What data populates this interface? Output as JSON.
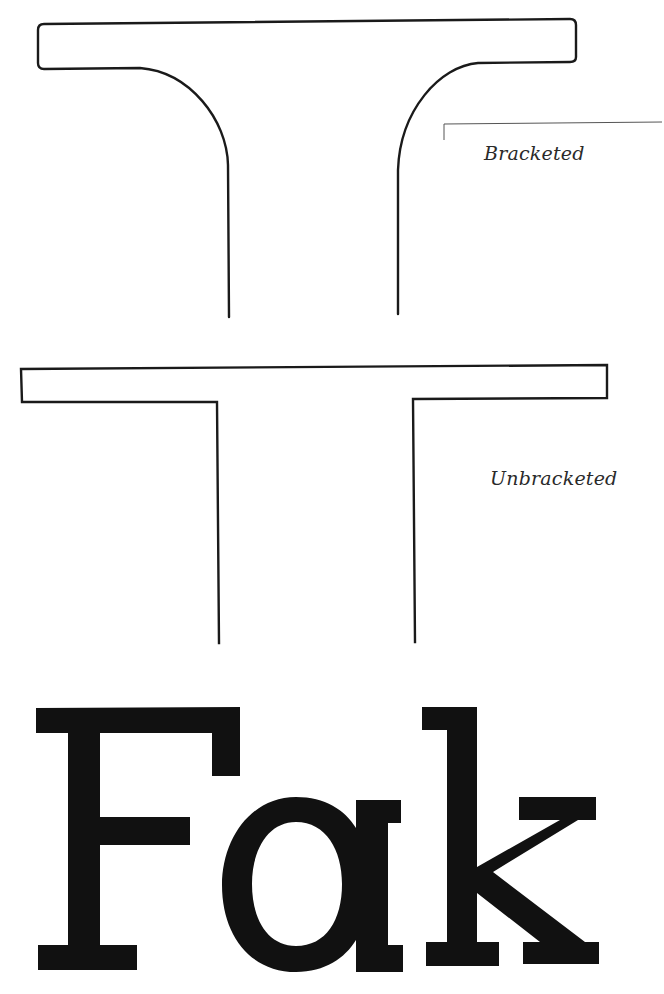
{
  "figure": {
    "type": "typography-illustration",
    "stroke_color": "#1a1a1a",
    "fill_color": "#111111",
    "background": "#ffffff"
  },
  "panels": [
    {
      "id": "bracketed",
      "label": "Bracketed",
      "description": "Serif joined to stem with curved bracket"
    },
    {
      "id": "unbracketed",
      "label": "Unbracketed",
      "description": "Serif meets stem at a sharp right angle"
    }
  ],
  "labels": {
    "bracketed": "Bracketed",
    "unbracketed": "Unbracketed"
  },
  "specimen": {
    "text": "Fak",
    "letters": [
      "F",
      "a",
      "k"
    ],
    "style": "slab serif, unbracketed"
  }
}
